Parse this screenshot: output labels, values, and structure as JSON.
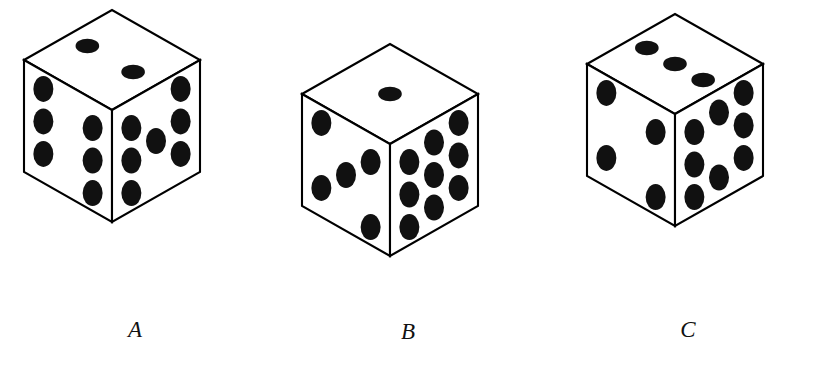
{
  "figure": {
    "background_color": "#ffffff",
    "ink_color": "#111111",
    "stroke_color": "#000000",
    "width": 814,
    "height": 367
  },
  "dice": [
    {
      "label": "A",
      "label_x": 115,
      "label_y": 318,
      "origin_x": 22,
      "origin_y": 8,
      "faces": {
        "top": {
          "name": "top-face",
          "pip_count": 2,
          "pips": [
            [
              0.5,
              0.22
            ],
            [
              0.5,
              0.74
            ]
          ]
        },
        "left": {
          "name": "left-face",
          "pip_count": 6,
          "pips": [
            [
              0.22,
              0.16
            ],
            [
              0.22,
              0.45
            ],
            [
              0.22,
              0.74
            ],
            [
              0.78,
              0.26
            ],
            [
              0.78,
              0.55
            ],
            [
              0.78,
              0.84
            ]
          ]
        },
        "right": {
          "name": "right-face",
          "pip_count": 7,
          "pips": [
            [
              0.22,
              0.26
            ],
            [
              0.22,
              0.55
            ],
            [
              0.22,
              0.84
            ],
            [
              0.5,
              0.5
            ],
            [
              0.78,
              0.16
            ],
            [
              0.78,
              0.45
            ],
            [
              0.78,
              0.74
            ]
          ]
        }
      }
    },
    {
      "label": "B",
      "label_x": 388,
      "label_y": 320,
      "origin_x": 300,
      "origin_y": 42,
      "faces": {
        "top": {
          "name": "top-face",
          "pip_count": 1,
          "pips": [
            [
              0.5,
              0.5
            ]
          ]
        },
        "left": {
          "name": "left-face",
          "pip_count": 5,
          "pips": [
            [
              0.22,
              0.16
            ],
            [
              0.22,
              0.74
            ],
            [
              0.5,
              0.5
            ],
            [
              0.78,
              0.26
            ],
            [
              0.78,
              0.84
            ]
          ]
        },
        "right": {
          "name": "right-face",
          "pip_count": 9,
          "pips": [
            [
              0.22,
              0.26
            ],
            [
              0.22,
              0.55
            ],
            [
              0.22,
              0.84
            ],
            [
              0.5,
              0.21
            ],
            [
              0.5,
              0.5
            ],
            [
              0.5,
              0.79
            ],
            [
              0.78,
              0.16
            ],
            [
              0.78,
              0.45
            ],
            [
              0.78,
              0.74
            ]
          ]
        }
      }
    },
    {
      "label": "C",
      "label_x": 668,
      "label_y": 318,
      "origin_x": 585,
      "origin_y": 12,
      "faces": {
        "top": {
          "name": "top-face",
          "pip_count": 3,
          "pips": [
            [
              0.5,
              0.18
            ],
            [
              0.5,
              0.5
            ],
            [
              0.5,
              0.82
            ]
          ]
        },
        "left": {
          "name": "left-face",
          "pip_count": 4,
          "pips": [
            [
              0.22,
              0.16
            ],
            [
              0.22,
              0.74
            ],
            [
              0.78,
              0.26
            ],
            [
              0.78,
              0.84
            ]
          ]
        },
        "right": {
          "name": "right-face",
          "pip_count": 8,
          "pips": [
            [
              0.22,
              0.26
            ],
            [
              0.22,
              0.55
            ],
            [
              0.22,
              0.84
            ],
            [
              0.5,
              0.21
            ],
            [
              0.5,
              0.79
            ],
            [
              0.78,
              0.16
            ],
            [
              0.78,
              0.45
            ],
            [
              0.78,
              0.74
            ]
          ]
        }
      }
    }
  ],
  "geometry": {
    "half_width": 88,
    "top_height": 50,
    "side_height": 112,
    "pip_radius_x": 10,
    "pip_radius_y": 13
  }
}
